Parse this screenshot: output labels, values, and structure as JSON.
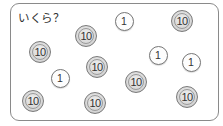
{
  "question": "いくら？",
  "coins": [
    {
      "value": "10",
      "x": 86,
      "y": 36
    },
    {
      "value": "1",
      "x": 124,
      "y": 21
    },
    {
      "value": "10",
      "x": 182,
      "y": 21
    },
    {
      "value": "10",
      "x": 40,
      "y": 52
    },
    {
      "value": "1",
      "x": 158,
      "y": 55
    },
    {
      "value": "10",
      "x": 97,
      "y": 67
    },
    {
      "value": "1",
      "x": 60,
      "y": 78
    },
    {
      "value": "1",
      "x": 191,
      "y": 62
    },
    {
      "value": "10",
      "x": 136,
      "y": 82
    },
    {
      "value": "10",
      "x": 33,
      "y": 101
    },
    {
      "value": "10",
      "x": 95,
      "y": 103
    },
    {
      "value": "10",
      "x": 187,
      "y": 97
    }
  ]
}
